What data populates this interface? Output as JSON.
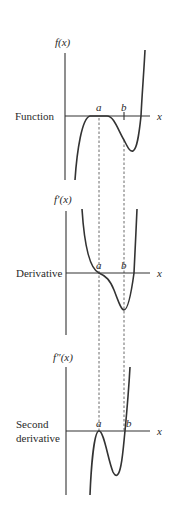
{
  "panels": [
    {
      "id": "function",
      "row_label": "Function",
      "y_label": "f(x)",
      "x_label": "x",
      "point_a": "a",
      "point_b": "b"
    },
    {
      "id": "derivative",
      "row_label": "Derivative",
      "y_label": "f′(x)",
      "x_label": "x",
      "point_a": "a",
      "point_b": "b"
    },
    {
      "id": "second-derivative",
      "row_label_line1": "Second",
      "row_label_line2": "derivative",
      "y_label": "f″(x)",
      "x_label": "x",
      "point_a": "a",
      "point_b": "b"
    }
  ],
  "colors": {
    "line": "#333333",
    "background": "#ffffff"
  }
}
